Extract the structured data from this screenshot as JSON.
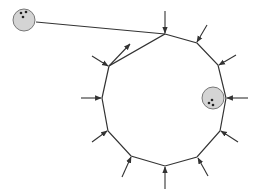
{
  "figure": {
    "colors": {
      "line": "#333333",
      "ball_fill": "#d4d4d4",
      "ball_stroke": "#777777",
      "dot": "#222222",
      "background": "#ffffff"
    },
    "polygon": {
      "vertices": [
        [
          165,
          34
        ],
        [
          197,
          43
        ],
        [
          218,
          65
        ],
        [
          226,
          98
        ],
        [
          220,
          131
        ],
        [
          197,
          157
        ],
        [
          165,
          166
        ],
        [
          131,
          156
        ],
        [
          108,
          131
        ],
        [
          102,
          98
        ],
        [
          109,
          66
        ]
      ]
    },
    "tether": {
      "from": [
        36,
        22
      ],
      "to": [
        165,
        34
      ]
    },
    "arrows_inward": [
      {
        "from": [
          165,
          11
        ],
        "to": [
          165,
          33
        ]
      },
      {
        "from": [
          207,
          25
        ],
        "to": [
          197,
          42
        ]
      },
      {
        "from": [
          236,
          55
        ],
        "to": [
          219,
          65
        ]
      },
      {
        "from": [
          248,
          98
        ],
        "to": [
          227,
          98
        ]
      },
      {
        "from": [
          238,
          142
        ],
        "to": [
          221,
          131
        ]
      },
      {
        "from": [
          208,
          176
        ],
        "to": [
          198,
          158
        ]
      },
      {
        "from": [
          165,
          189
        ],
        "to": [
          165,
          167
        ]
      },
      {
        "from": [
          122,
          177
        ],
        "to": [
          131,
          157
        ]
      },
      {
        "from": [
          92,
          142
        ],
        "to": [
          107,
          131
        ]
      },
      {
        "from": [
          81,
          98
        ],
        "to": [
          101,
          98
        ]
      },
      {
        "from": [
          92,
          56
        ],
        "to": [
          108,
          66
        ]
      }
    ],
    "arrows_outward": [
      {
        "from": [
          109,
          66
        ],
        "to": [
          130,
          44
        ]
      }
    ],
    "particles": [
      {
        "name": "tethered-particle",
        "cx": 24,
        "cy": 20,
        "r": 11,
        "dots": [
          [
            21,
            13
          ],
          [
            26,
            12
          ],
          [
            23,
            17
          ]
        ]
      },
      {
        "name": "edge-particle",
        "cx": 213,
        "cy": 98,
        "r": 11,
        "dots": [
          [
            212,
            100
          ],
          [
            209,
            103
          ],
          [
            213,
            105
          ]
        ]
      }
    ]
  }
}
